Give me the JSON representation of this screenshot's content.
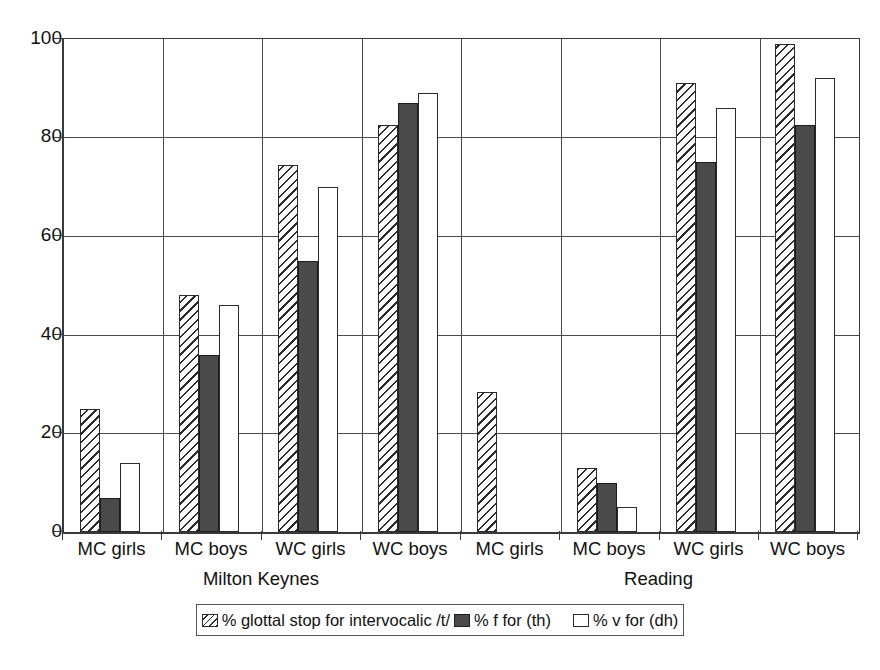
{
  "chart_data": {
    "type": "bar",
    "title": "",
    "subtitle": "",
    "xlabel": "",
    "ylabel": "",
    "ylim": [
      0,
      100
    ],
    "yticks": [
      0,
      20,
      40,
      60,
      80,
      100
    ],
    "grid": true,
    "legend_position": "bottom",
    "categories": [
      "MC girls",
      "MC boys",
      "WC girls",
      "WC boys",
      "MC girls",
      "MC boys",
      "WC girls",
      "WC boys"
    ],
    "groups": [
      {
        "name": "Milton Keynes",
        "categories": [
          "MC girls",
          "MC boys",
          "WC girls",
          "WC boys"
        ]
      },
      {
        "name": "Reading",
        "categories": [
          "MC girls",
          "MC boys",
          "WC girls",
          "WC boys"
        ]
      }
    ],
    "series": [
      {
        "name": "% glottal stop for intervocalic /t/",
        "fill": "hatched",
        "values": [
          25,
          48,
          74.5,
          82.5,
          28.5,
          13,
          91,
          99
        ]
      },
      {
        "name": "% f for (th)",
        "fill": "solid-dark",
        "values": [
          7,
          36,
          55,
          87,
          null,
          10,
          75,
          82.5
        ]
      },
      {
        "name": "% v for (dh)",
        "fill": "open-white",
        "values": [
          14,
          46,
          70,
          89,
          null,
          5,
          86,
          92
        ]
      }
    ]
  },
  "legend": {
    "items": [
      {
        "label": "% glottal stop for intervocalic /t/",
        "swatch": "hatched-swatch-icon"
      },
      {
        "label": "% f for (th)",
        "swatch": "solid-dark-swatch-icon"
      },
      {
        "label": "% v for (dh)",
        "swatch": "open-white-swatch-icon"
      }
    ]
  },
  "colors": {
    "hatched_line": "#2b2b2b",
    "solid_dark": "#4a4a4a",
    "open_white": "#ffffff",
    "axis": "#3a3a3a",
    "grid": "#4a4a4a",
    "background": "#ffffff"
  }
}
